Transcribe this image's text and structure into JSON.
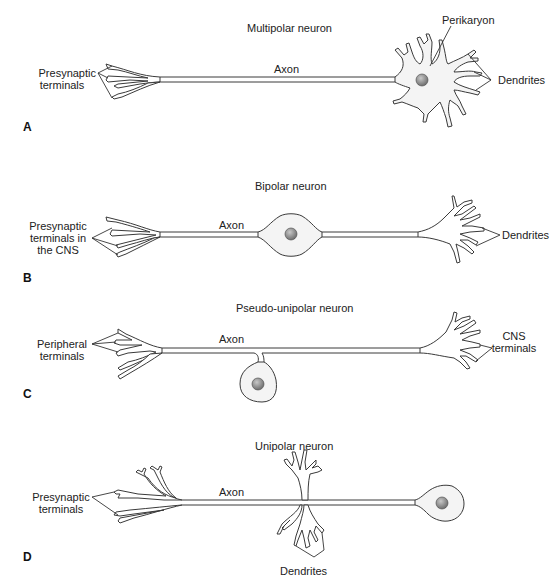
{
  "figure": {
    "panels": [
      {
        "letter": "A",
        "title": "Multipolar neuron",
        "labels": {
          "left": [
            "Presynaptic",
            "terminals"
          ],
          "axon": "Axon",
          "perikaryon": "Perikaryon",
          "right": "Dendrites"
        }
      },
      {
        "letter": "B",
        "title": "Bipolar neuron",
        "labels": {
          "left": [
            "Presynaptic",
            "terminals in",
            "the CNS"
          ],
          "axon": "Axon",
          "right": "Dendrites"
        }
      },
      {
        "letter": "C",
        "title": "Pseudo-unipolar neuron",
        "labels": {
          "left": [
            "Peripheral",
            "terminals"
          ],
          "axon": "Axon",
          "right": [
            "CNS",
            "terminals"
          ]
        }
      },
      {
        "letter": "D",
        "title": "Unipolar neuron",
        "labels": {
          "left": [
            "Presynaptic",
            "terminals"
          ],
          "axon": "Axon",
          "bottom": "Dendrites"
        }
      }
    ],
    "colors": {
      "background": "#ffffff",
      "outline": "#3a3a3a",
      "cell_body_fill": "#f4f4f4",
      "nucleus_fill": "#8a8a8a"
    }
  }
}
